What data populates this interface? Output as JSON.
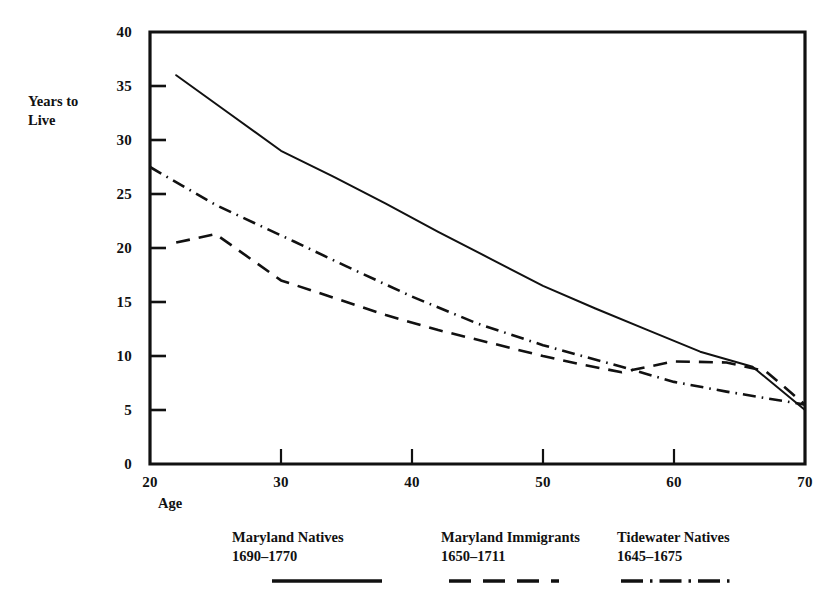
{
  "chart_data": {
    "type": "line",
    "title": "",
    "xlabel": "Age",
    "ylabel": "Years to Live",
    "xlim": [
      20,
      70
    ],
    "ylim": [
      0,
      40
    ],
    "xticks": [
      20,
      30,
      40,
      50,
      60,
      70
    ],
    "yticks": [
      0,
      5,
      10,
      15,
      20,
      25,
      30,
      35,
      40
    ],
    "grid": false,
    "legend_position": "bottom",
    "series": [
      {
        "name": "Maryland Natives",
        "period": "1690–1770",
        "style": "solid",
        "color": "#111111",
        "x": [
          22,
          26,
          30,
          34,
          38,
          42,
          46,
          50,
          54,
          58,
          62,
          66,
          70
        ],
        "values": [
          36.0,
          32.5,
          29.0,
          26.6,
          24.1,
          21.5,
          19.0,
          16.5,
          14.4,
          12.4,
          10.4,
          9.0,
          5.0
        ]
      },
      {
        "name": "Maryland Immigrants",
        "period": "1650–1711",
        "style": "dashed",
        "color": "#111111",
        "x": [
          22,
          25,
          30,
          34,
          38,
          42,
          46,
          50,
          53,
          56,
          60,
          64,
          67,
          70
        ],
        "values": [
          20.5,
          21.3,
          17.0,
          15.4,
          13.8,
          12.4,
          11.2,
          10.0,
          9.2,
          8.5,
          9.5,
          9.4,
          8.6,
          5.5
        ]
      },
      {
        "name": "Tidewater Natives",
        "period": "1645–1675",
        "style": "dash-dot",
        "color": "#111111",
        "x": [
          20,
          23,
          25,
          28,
          31,
          35,
          40,
          45,
          50,
          53,
          56,
          60,
          64,
          67,
          70
        ],
        "values": [
          27.5,
          25.4,
          24.0,
          22.3,
          20.6,
          18.3,
          15.5,
          13.0,
          11.0,
          10.0,
          9.0,
          7.6,
          6.7,
          6.1,
          5.5
        ]
      }
    ]
  },
  "axes": {
    "y_title_line1": "Years to",
    "y_title_line2": "Live",
    "x_title": "Age",
    "ytick_labels": [
      "0",
      "5",
      "10",
      "15",
      "20",
      "25",
      "30",
      "35",
      "40"
    ],
    "xtick_labels": [
      "20",
      "30",
      "40",
      "50",
      "60",
      "70"
    ]
  },
  "legend": {
    "entries": [
      {
        "name": "Maryland Natives",
        "period": "1690–1770",
        "style": "solid"
      },
      {
        "name": "Maryland Immigrants",
        "period": "1650–1711",
        "style": "dashed"
      },
      {
        "name": "Tidewater Natives",
        "period": "1645–1675",
        "style": "dash-dot"
      }
    ]
  }
}
